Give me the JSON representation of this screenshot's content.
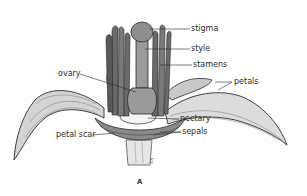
{
  "diagram": {
    "caption": "A",
    "labels": {
      "stigma": "stigma",
      "style": "style",
      "stamens": "stamens",
      "ovary": "ovary",
      "petals": "petals",
      "nectary": "nectary",
      "petal_scar": "petal scar",
      "sepals": "sepals"
    },
    "colors": {
      "background": "#ffffff",
      "petal_fill": "#d9d9d9",
      "dark_fill": "#6a6a6a",
      "mid_fill": "#9a9a9a",
      "outline": "#2a2a2a",
      "nectary_fill": "#f4f4f4"
    }
  }
}
